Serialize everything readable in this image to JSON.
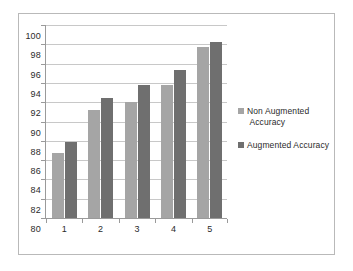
{
  "chart_data": {
    "type": "bar",
    "title": "",
    "xlabel": "",
    "ylabel": "",
    "categories": [
      "1",
      "2",
      "3",
      "4",
      "5"
    ],
    "series": [
      {
        "name": "Non Augmented Accuracy",
        "color": "#a5a5a5",
        "values": [
          86.7,
          91.2,
          92.0,
          93.8,
          97.7
        ]
      },
      {
        "name": "Augmented Accuracy",
        "color": "#6f6f6f",
        "values": [
          87.9,
          92.4,
          93.8,
          95.3,
          98.25
        ]
      }
    ],
    "ylim": [
      80,
      100
    ],
    "ytick_step": 2,
    "yticks": [
      80,
      82,
      84,
      86,
      88,
      90,
      92,
      94,
      96,
      98,
      100
    ],
    "ytick_labels": [
      "80",
      "82",
      "84",
      "86",
      "88",
      "90",
      "92",
      "94",
      "96",
      "98",
      "100"
    ],
    "grid": true,
    "grid_axis": "y",
    "legend_position": "right",
    "legend": [
      {
        "label_line_1": "Non Augmented",
        "label_line_2": "Accuracy"
      },
      {
        "label_line_1": "Augmented Accuracy",
        "label_line_2": ""
      }
    ]
  }
}
